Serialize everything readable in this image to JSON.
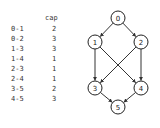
{
  "table": {
    "header": "cap",
    "rows": [
      {
        "edge": "0-1",
        "cap": "2"
      },
      {
        "edge": "0-2",
        "cap": "3"
      },
      {
        "edge": "1-3",
        "cap": "3"
      },
      {
        "edge": "1-4",
        "cap": "1"
      },
      {
        "edge": "2-3",
        "cap": "1"
      },
      {
        "edge": "2-4",
        "cap": "1"
      },
      {
        "edge": "3-5",
        "cap": "2"
      },
      {
        "edge": "4-5",
        "cap": "3"
      }
    ]
  },
  "graph": {
    "nodes": [
      {
        "id": "0",
        "x": 118,
        "y": 18
      },
      {
        "id": "1",
        "x": 95,
        "y": 42
      },
      {
        "id": "2",
        "x": 141,
        "y": 42
      },
      {
        "id": "3",
        "x": 95,
        "y": 88
      },
      {
        "id": "4",
        "x": 141,
        "y": 88
      },
      {
        "id": "5",
        "x": 118,
        "y": 107
      }
    ],
    "edges": [
      [
        "0",
        "1"
      ],
      [
        "0",
        "2"
      ],
      [
        "1",
        "3"
      ],
      [
        "1",
        "4"
      ],
      [
        "2",
        "3"
      ],
      [
        "2",
        "4"
      ],
      [
        "3",
        "5"
      ],
      [
        "4",
        "5"
      ]
    ]
  }
}
